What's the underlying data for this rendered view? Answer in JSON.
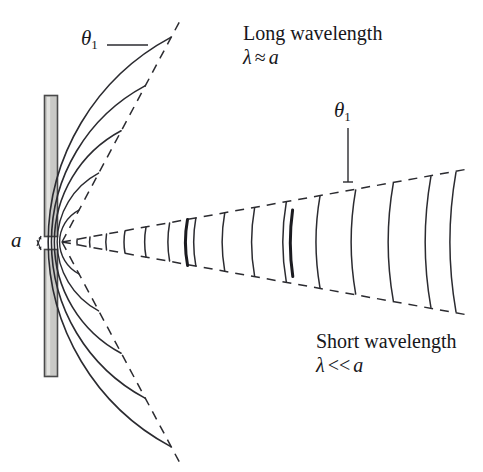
{
  "figure": {
    "kind": "single-slit-diffraction-diagram",
    "background_color": "#ffffff",
    "stroke_color": "#2b2b30",
    "barrier_fill_color": "#c9c9c6",
    "barrier_edge_color": "#4a4a4a"
  },
  "labels": {
    "long_wavelength_title": "Long wavelength",
    "long_wavelength_condition_lambda": "λ",
    "long_wavelength_condition_op": "≈",
    "long_wavelength_condition_a": "a",
    "short_wavelength_title": "Short wavelength",
    "short_wavelength_condition_lambda": "λ",
    "short_wavelength_condition_op": "<<",
    "short_wavelength_condition_a": "a",
    "theta_symbol": "θ",
    "theta_subscript": "1",
    "slit_width_symbol": "a"
  },
  "annotations": {
    "theta_left_name": "diffraction-angle-long-wavelength",
    "theta_right_name": "diffraction-angle-short-wavelength",
    "slit_label_name": "slit-width"
  },
  "geometry": {
    "slit_center_x": 62,
    "slit_center_y": 242,
    "barrier_x": 44,
    "barrier_width": 14,
    "barrier_top_y": 95,
    "barrier_top_height": 142,
    "barrier_bottom_y": 249,
    "barrier_bottom_height": 128,
    "long_half_angle_deg": 62,
    "short_half_angle_deg": 10,
    "long_wavefront_radii": [
      36,
      78,
      126,
      177,
      232,
      289,
      350,
      412
    ],
    "short_wavefront_x": [
      78,
      92,
      108,
      126,
      147,
      170,
      196,
      224,
      254,
      286,
      320,
      356,
      394,
      432,
      458
    ],
    "emphasized_wavefront_indices": [
      3,
      5
    ]
  }
}
